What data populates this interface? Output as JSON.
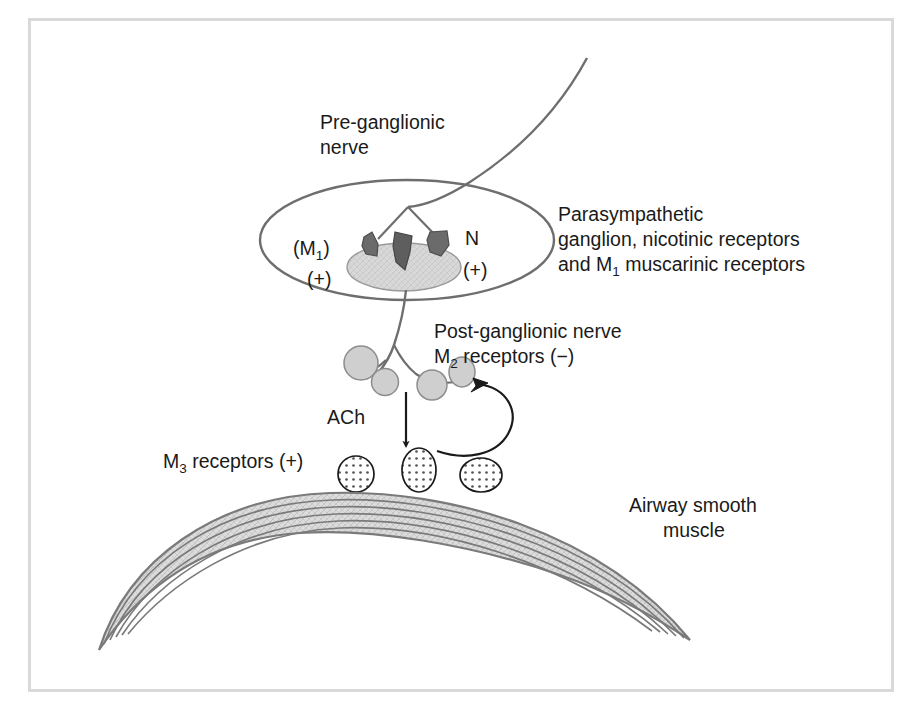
{
  "figure": {
    "frame_color": "#d9d9d9",
    "background": "#ffffff"
  },
  "colors": {
    "line": "#6e6e6e",
    "text": "#1a1a1a",
    "receptor_dark": "#616161",
    "cell_body_fill": "#d4d4d4",
    "varicosity_fill": "#cccccc",
    "muscle_fill": "#d6d6d6",
    "muscle_line": "#7a7a7a",
    "stipple": "#555555"
  },
  "labels": {
    "preganglionic": {
      "line1": "Pre-ganglionic",
      "line2": "nerve"
    },
    "ganglion": {
      "line1": "Parasympathetic",
      "line2": "ganglion, nicotinic receptors",
      "line3_pre": "and M",
      "line3_sub": "1",
      "line3_post": " muscarinic receptors"
    },
    "postganglionic": {
      "line1": "Post-ganglionic nerve",
      "line2_pre": "M",
      "line2_sub": "2",
      "line2_post": " receptors (−)"
    },
    "m3": {
      "pre": "M",
      "sub": "3",
      "post": " receptors (+)"
    },
    "ach": "ACh",
    "muscle": {
      "line1": "Airway smooth",
      "line2": "muscle"
    },
    "ganglion_inner": {
      "m1_pre": "(M",
      "m1_sub": "1",
      "m1_post": ")",
      "m1_sign": "(+)",
      "n": "N",
      "n_sign": "(+)"
    }
  },
  "elements": {
    "preganglionic_nerve": "curved nerve fibre descending from upper right",
    "ganglion_outline": "large ellipse enclosing the ganglion",
    "ganglion_cell_body": "shaded oval neuron cell body",
    "receptor_wedges": 3,
    "varicosities": 4,
    "m3_receptor_count": 3,
    "muscle_striation_lines": 5
  }
}
